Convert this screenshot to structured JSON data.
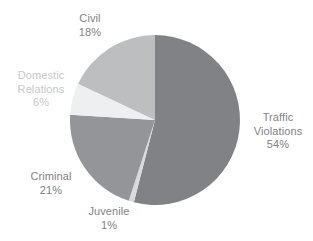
{
  "chart_data": {
    "type": "pie",
    "title": "",
    "subtitle": "",
    "xlabel": "",
    "ylabel": "",
    "legend_position": "none",
    "grid": false,
    "labels_inline": true,
    "start_angle_deg": 0,
    "direction": "clockwise",
    "categories": [
      "Traffic Violations",
      "Juvenile",
      "Criminal",
      "Domestic Relations",
      "Civil"
    ],
    "values": [
      54,
      21,
      18,
      6,
      1
    ],
    "unit": "%",
    "slices": [
      {
        "name": "Traffic Violations",
        "label_line1": "Traffic",
        "label_line2": "Violations",
        "value": 54,
        "value_text": "54%",
        "color": "#808285",
        "label_color": "#808285"
      },
      {
        "name": "Juvenile",
        "label_line1": "Juvenile",
        "label_line2": "",
        "value": 1,
        "value_text": "1%",
        "color": "#d9dadb",
        "label_color": "#808285"
      },
      {
        "name": "Criminal",
        "label_line1": "Criminal",
        "label_line2": "",
        "value": 21,
        "value_text": "21%",
        "color": "#939598",
        "label_color": "#808285"
      },
      {
        "name": "Domestic Relations",
        "label_line1": "Domestic",
        "label_line2": "Relations",
        "value": 6,
        "value_text": "6%",
        "color": "#eeeff0",
        "label_color": "#c6c8ca"
      },
      {
        "name": "Civil",
        "label_line1": "Civil",
        "label_line2": "",
        "value": 18,
        "value_text": "18%",
        "color": "#bcbec0",
        "label_color": "#808285"
      }
    ]
  },
  "colors": {
    "background": "#ffffff",
    "traffic_violations": "#808285",
    "juvenile": "#d9dadb",
    "criminal": "#939598",
    "domestic_relations": "#eeeff0",
    "civil": "#bcbec0",
    "label_default": "#808285",
    "label_light": "#c6c8ca"
  }
}
